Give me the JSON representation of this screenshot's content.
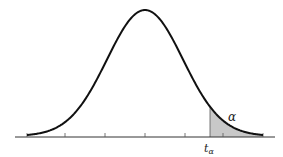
{
  "diagram": {
    "type": "t-distribution-upper-tail",
    "labels": {
      "alpha": "α",
      "critical_value": "t",
      "critical_value_subscript": "α"
    },
    "colors": {
      "curve": "#111111",
      "axis": "#333333",
      "shade": "#c8c8c8",
      "background": "#ffffff"
    },
    "geometry": {
      "axis_y": 137,
      "axis_x_start": 15,
      "axis_x_end": 275,
      "center_x": 145,
      "peak_y": 10,
      "tail_left_x": 27,
      "tail_right_x": 263,
      "critical_x": 210,
      "tick_x": [
        27,
        65,
        105,
        145,
        185,
        223,
        263
      ]
    }
  }
}
